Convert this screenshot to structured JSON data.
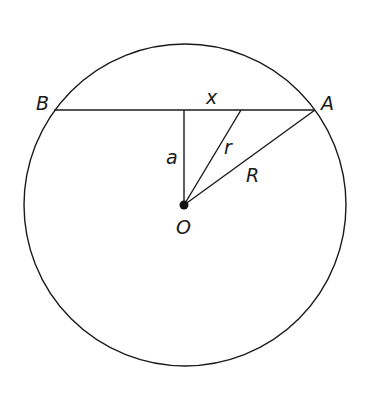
{
  "diagram": {
    "labels": {
      "B": "B",
      "A": "A",
      "x": "x",
      "a": "a",
      "r": "r",
      "R": "R",
      "O": "O"
    },
    "geometry": {
      "circle": {
        "cx": 185,
        "cy": 205,
        "r": 161
      },
      "chord": {
        "x1": 54,
        "y1": 110,
        "x2": 315,
        "y2": 110
      },
      "perpendicular_foot": {
        "x": 184,
        "y": 110
      },
      "r_endpoint": {
        "x": 241,
        "y": 110
      },
      "center": {
        "x": 184,
        "y": 205
      }
    },
    "colors": {
      "stroke": "#1a1a1a",
      "background": "#ffffff"
    }
  }
}
